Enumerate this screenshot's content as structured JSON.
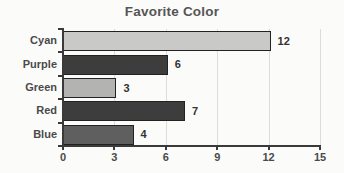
{
  "chart": {
    "title": "Favorite Color"
  },
  "chart_data": {
    "type": "bar",
    "orientation": "horizontal",
    "title": "Favorite Color",
    "categories": [
      "Cyan",
      "Purple",
      "Green",
      "Red",
      "Blue"
    ],
    "values": [
      12,
      6,
      3,
      7,
      4
    ],
    "value_labels": [
      "12",
      "6",
      "3",
      "7",
      "4"
    ],
    "bar_colors": [
      "#c9c9c7",
      "#3d3d3d",
      "#b3b3b1",
      "#3d3d3d",
      "#5f5f5f"
    ],
    "xlabel": "",
    "ylabel": "",
    "xlim": [
      0,
      15
    ],
    "xticks": [
      0,
      3,
      6,
      9,
      12,
      15
    ],
    "grid": "vertical-gridlines-at-ticks",
    "legend": "none"
  },
  "colors": {
    "background": "#fbfbfa",
    "gridline": "#dcdcda",
    "axis": "#3a3a3a",
    "text": "#4a4a4a",
    "bar_border": "#222222"
  }
}
